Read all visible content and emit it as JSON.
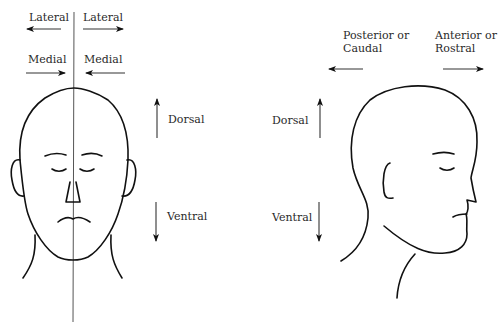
{
  "figure": {
    "front_view": {
      "labels": {
        "lateral_left": "Lateral",
        "lateral_right": "Lateral",
        "medial_left": "Medial",
        "medial_right": "Medial",
        "dorsal": "Dorsal",
        "ventral": "Ventral"
      },
      "arrows": {
        "lateral_left": "left",
        "lateral_right": "right",
        "medial_left": "right",
        "medial_right": "left",
        "dorsal": "up",
        "ventral": "down"
      },
      "midline": "vertical midline through head"
    },
    "side_view": {
      "labels": {
        "posterior_line1": "Posterior or",
        "posterior_line2": "Caudal",
        "anterior_line1": "Anterior or",
        "anterior_line2": "Rostral",
        "dorsal": "Dorsal",
        "ventral": "Ventral"
      },
      "arrows": {
        "posterior": "left",
        "anterior": "right",
        "dorsal": "up",
        "ventral": "down"
      }
    },
    "colors": {
      "background": "#ffffff",
      "line": "#111111",
      "text": "#2a2a2a"
    }
  }
}
